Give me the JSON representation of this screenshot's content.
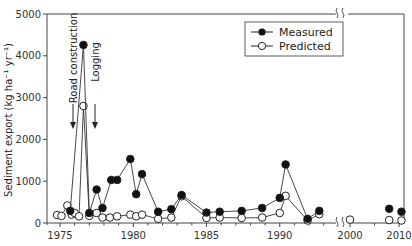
{
  "chart_data": {
    "type": "line",
    "title": "",
    "xlabel": "",
    "ylabel": "Sediment export (kg ha⁻¹ yr⁻¹)",
    "ylim": [
      0,
      5000
    ],
    "yticks": [
      0,
      1000,
      2000,
      3000,
      4000,
      5000
    ],
    "xticks": [
      1975,
      1980,
      1985,
      1990,
      2000,
      2010
    ],
    "xtick_labels": [
      "1975",
      "1980",
      "1985",
      "1990",
      "2000",
      "2010"
    ],
    "axis_break": "between 1993 and 2000 on x-axis (shown by squiggle marks)",
    "grid": false,
    "legend_position": "upper right",
    "annotations": [
      {
        "text": "Road construction",
        "x": 1975.9,
        "arrow": "down"
      },
      {
        "text": "Logging",
        "x": 1977.4,
        "arrow": "down"
      }
    ],
    "series": [
      {
        "name": "Measured",
        "marker": "filled-circle",
        "points": [
          [
            1975.7,
            290
          ],
          [
            1976.6,
            4260
          ],
          [
            1977.0,
            240
          ],
          [
            1977.5,
            800
          ],
          [
            1977.9,
            360
          ],
          [
            1978.5,
            1030
          ],
          [
            1978.9,
            1030
          ],
          [
            1979.8,
            1530
          ],
          [
            1980.2,
            690
          ],
          [
            1980.6,
            1170
          ],
          [
            1981.7,
            270
          ],
          [
            1982.6,
            330
          ],
          [
            1983.3,
            670
          ],
          [
            1985.0,
            250
          ],
          [
            1985.9,
            270
          ],
          [
            1987.4,
            290
          ],
          [
            1988.8,
            360
          ],
          [
            1990.0,
            600
          ],
          [
            1990.4,
            1400
          ],
          [
            1991.9,
            100
          ],
          [
            1992.7,
            290
          ],
          [
            2008.0,
            340
          ],
          [
            2010.5,
            270
          ]
        ]
      },
      {
        "name": "Predicted",
        "marker": "open-circle",
        "points": [
          [
            1974.8,
            190
          ],
          [
            1975.1,
            170
          ],
          [
            1975.5,
            420
          ],
          [
            1975.8,
            200
          ],
          [
            1976.0,
            240
          ],
          [
            1976.3,
            160
          ],
          [
            1976.6,
            2800
          ],
          [
            1977.0,
            170
          ],
          [
            1977.5,
            240
          ],
          [
            1977.9,
            130
          ],
          [
            1978.4,
            130
          ],
          [
            1978.9,
            160
          ],
          [
            1979.8,
            200
          ],
          [
            1980.2,
            160
          ],
          [
            1980.6,
            200
          ],
          [
            1981.7,
            100
          ],
          [
            1982.6,
            130
          ],
          [
            1983.3,
            640
          ],
          [
            1985.0,
            120
          ],
          [
            1985.9,
            130
          ],
          [
            1987.4,
            120
          ],
          [
            1988.8,
            130
          ],
          [
            1990.0,
            240
          ],
          [
            1990.4,
            650
          ],
          [
            1991.9,
            60
          ],
          [
            1992.7,
            210
          ],
          [
            2000.0,
            80
          ],
          [
            2008.0,
            70
          ],
          [
            2010.5,
            60
          ]
        ]
      }
    ]
  },
  "legend": {
    "measured": "Measured",
    "predicted": "Predicted"
  },
  "annotations": {
    "road": "Road construction",
    "logging": "Logging"
  },
  "axis": {
    "ylabel": "Sediment export (kg ha⁻¹ yr⁻¹)",
    "y_ticks": [
      "0",
      "1000",
      "2000",
      "3000",
      "4000",
      "5000"
    ],
    "x_ticks": [
      "1975",
      "1980",
      "1985",
      "1990",
      "2000",
      "2010"
    ]
  }
}
